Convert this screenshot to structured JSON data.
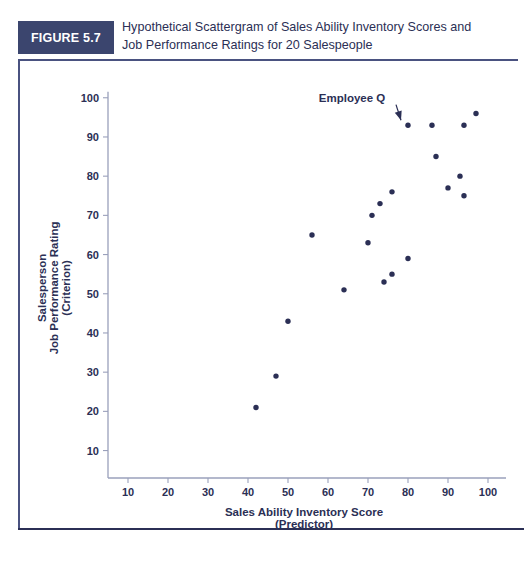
{
  "figure": {
    "badge_label": "FIGURE 5.7",
    "title_line1": "Hypothetical Scattergram of Sales Ability Inventory Scores and",
    "title_line2": "Job Performance Ratings for 20 Salespeople"
  },
  "colors": {
    "badge_bg": "#3b456e",
    "badge_text": "#ffffff",
    "ink": "#2b2f55",
    "axis": "#9aa0bb",
    "frame": "#4a5280",
    "page_bg": "#ffffff"
  },
  "chart_data": {
    "type": "scatter",
    "title": "Hypothetical Scattergram of Sales Ability Inventory Scores and Job Performance Ratings for 20 Salespeople",
    "xlabel": "Sales Ability Inventory Score",
    "xlabel_sub": "(Predictor)",
    "ylabel_line1": "Salesperson",
    "ylabel_line2": "Job Performance Rating",
    "ylabel_line3": "(Criterion)",
    "xlim": [
      5,
      103
    ],
    "ylim": [
      3,
      103
    ],
    "xticks": [
      10,
      20,
      30,
      40,
      50,
      60,
      70,
      80,
      90,
      100
    ],
    "yticks": [
      10,
      20,
      30,
      40,
      50,
      60,
      70,
      80,
      90,
      100
    ],
    "grid": false,
    "legend": "none",
    "series": [
      {
        "name": "Salespeople",
        "points": [
          {
            "x": 42,
            "y": 21
          },
          {
            "x": 47,
            "y": 29
          },
          {
            "x": 50,
            "y": 43
          },
          {
            "x": 56,
            "y": 65
          },
          {
            "x": 64,
            "y": 51
          },
          {
            "x": 70,
            "y": 63
          },
          {
            "x": 71,
            "y": 70
          },
          {
            "x": 73,
            "y": 73
          },
          {
            "x": 74,
            "y": 53
          },
          {
            "x": 76,
            "y": 55
          },
          {
            "x": 76,
            "y": 76
          },
          {
            "x": 80,
            "y": 59
          },
          {
            "x": 80,
            "y": 93
          },
          {
            "x": 86,
            "y": 93
          },
          {
            "x": 87,
            "y": 85
          },
          {
            "x": 90,
            "y": 77
          },
          {
            "x": 93,
            "y": 80
          },
          {
            "x": 94,
            "y": 75
          },
          {
            "x": 94,
            "y": 93
          },
          {
            "x": 97,
            "y": 96
          }
        ]
      }
    ],
    "annotations": [
      {
        "label": "Employee Q",
        "target_x": 80,
        "target_y": 93,
        "text_x": 66,
        "text_y": 99
      }
    ]
  }
}
